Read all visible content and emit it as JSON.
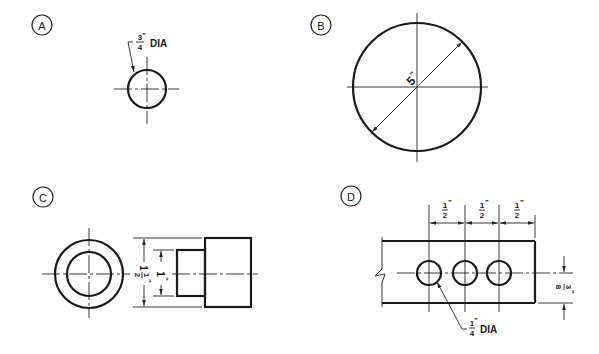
{
  "figures": [
    {
      "label": "A",
      "callout": {
        "numerator": "3",
        "denominator": "4",
        "unit": "\"",
        "suffix": "DIA"
      },
      "description": "single circle with centerlines"
    },
    {
      "label": "B",
      "dimension": {
        "value": "5",
        "unit": "\""
      },
      "description": "large circle with diagonal diameter dimension"
    },
    {
      "label": "C",
      "dimensions": [
        {
          "whole": "1",
          "numerator": "1",
          "denominator": "2",
          "unit": "\""
        },
        {
          "value": "1",
          "unit": "\""
        }
      ],
      "description": "stepped cylinder front and side views"
    },
    {
      "label": "D",
      "spacing": [
        {
          "numerator": "1",
          "denominator": "2",
          "unit": "\""
        },
        {
          "numerator": "1",
          "denominator": "2",
          "unit": "\""
        },
        {
          "numerator": "1",
          "denominator": "2",
          "unit": "\""
        }
      ],
      "edge_offset": {
        "numerator": "3",
        "denominator": "8",
        "unit": "\""
      },
      "callout": {
        "numerator": "1",
        "denominator": "4",
        "unit": "\"",
        "suffix": "DIA"
      },
      "hole_count": 3,
      "description": "plate with three equally spaced holes"
    }
  ],
  "colors": {
    "ink": "#1a1a1a",
    "paper": "#ffffff"
  }
}
